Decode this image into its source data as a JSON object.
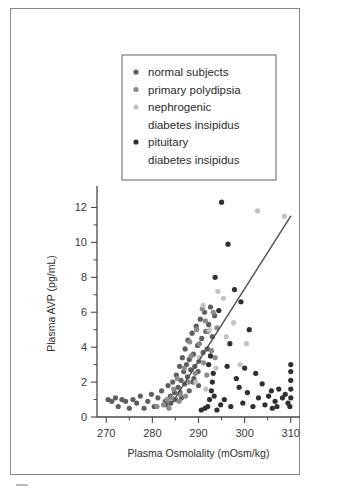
{
  "figure": {
    "frame_visible": true,
    "background": "#ffffff"
  },
  "chart_data": {
    "type": "scatter",
    "title": "",
    "xlabel": "Plasma Osmolality (mOsm/kg)",
    "ylabel": "Plasma AVP (pg/mL)",
    "xlim": [
      268,
      312
    ],
    "ylim": [
      0,
      13
    ],
    "xticks": [
      270,
      280,
      290,
      300,
      310
    ],
    "xtick_labels": [
      "270",
      "280",
      "290",
      "300",
      "310"
    ],
    "xticks_minor": [
      275,
      285,
      295,
      305
    ],
    "yticks": [
      0,
      2,
      4,
      6,
      8,
      10,
      12
    ],
    "ytick_labels": [
      "0",
      "2",
      "4",
      "6",
      "8",
      "10",
      "12"
    ],
    "yticks_minor": [
      1,
      3,
      5,
      7,
      9,
      11
    ],
    "grid": false,
    "legend_position": "upper-center",
    "marker_radius": 2.6,
    "series": [
      {
        "name": "normal subjects",
        "color": "#5f5f5f",
        "points": [
          [
            270.4,
            1.0
          ],
          [
            271.2,
            0.9
          ],
          [
            272.0,
            1.1
          ],
          [
            272.6,
            0.6
          ],
          [
            273.4,
            1.0
          ],
          [
            274.2,
            0.9
          ],
          [
            275.0,
            0.5
          ],
          [
            275.8,
            1.0
          ],
          [
            276.6,
            0.8
          ],
          [
            277.4,
            1.2
          ],
          [
            278.2,
            0.5
          ],
          [
            279.0,
            0.9
          ],
          [
            279.8,
            1.3
          ],
          [
            280.4,
            0.6
          ],
          [
            281.2,
            1.1
          ],
          [
            282.0,
            1.5
          ],
          [
            282.8,
            0.9
          ],
          [
            283.4,
            1.8
          ],
          [
            283.9,
            1.2
          ],
          [
            284.4,
            2.0
          ],
          [
            284.8,
            1.4
          ],
          [
            285.2,
            2.4
          ],
          [
            285.6,
            1.7
          ],
          [
            285.9,
            2.9
          ],
          [
            286.2,
            2.1
          ],
          [
            286.5,
            3.4
          ],
          [
            286.8,
            2.6
          ],
          [
            287.1,
            3.9
          ],
          [
            287.4,
            3.0
          ],
          [
            287.7,
            4.4
          ],
          [
            288.0,
            3.3
          ],
          [
            288.3,
            2.7
          ],
          [
            288.6,
            4.8
          ],
          [
            288.9,
            3.6
          ],
          [
            289.2,
            2.9
          ],
          [
            289.5,
            5.2
          ],
          [
            289.8,
            4.1
          ],
          [
            290.1,
            3.2
          ],
          [
            290.4,
            5.6
          ],
          [
            290.7,
            4.5
          ],
          [
            291.0,
            3.7
          ],
          [
            291.3,
            6.0
          ],
          [
            291.6,
            4.9
          ],
          [
            291.9,
            3.9
          ],
          [
            292.2,
            5.3
          ],
          [
            292.6,
            6.3
          ],
          [
            293.0,
            4.6
          ],
          [
            293.5,
            5.8
          ],
          [
            285.0,
            1.0
          ],
          [
            286.0,
            1.4
          ],
          [
            287.0,
            1.9
          ],
          [
            288.0,
            1.5
          ],
          [
            289.0,
            2.2
          ],
          [
            290.0,
            1.8
          ],
          [
            284.0,
            0.8
          ],
          [
            283.0,
            0.7
          ],
          [
            286.3,
            1.1
          ],
          [
            287.6,
            2.3
          ],
          [
            288.8,
            2.0
          ],
          [
            289.9,
            2.6
          ]
        ]
      },
      {
        "name": "primary polydipsia",
        "color": "#8c8c8c",
        "points": [
          [
            281.0,
            0.6
          ],
          [
            282.4,
            0.7
          ],
          [
            283.2,
            1.0
          ],
          [
            284.6,
            1.6
          ],
          [
            285.4,
            2.2
          ],
          [
            286.0,
            1.3
          ],
          [
            286.9,
            2.8
          ],
          [
            287.8,
            2.0
          ],
          [
            288.4,
            3.5
          ],
          [
            289.3,
            2.5
          ],
          [
            290.2,
            4.2
          ],
          [
            291.1,
            3.1
          ],
          [
            292.0,
            4.9
          ],
          [
            292.8,
            3.8
          ],
          [
            290.8,
            6.2
          ],
          [
            291.5,
            5.5
          ],
          [
            289.6,
            5.0
          ],
          [
            288.1,
            4.3
          ],
          [
            293.2,
            6.0
          ],
          [
            294.0,
            5.1
          ],
          [
            287.2,
            1.2
          ],
          [
            285.8,
            0.9
          ],
          [
            284.2,
            1.1
          ],
          [
            283.6,
            0.5
          ],
          [
            291.8,
            2.4
          ],
          [
            293.6,
            3.4
          ]
        ]
      },
      {
        "name": "nephrogenic diabetes insipidus",
        "color": "#c3c3c3",
        "points": [
          [
            291.0,
            6.4
          ],
          [
            292.4,
            5.0
          ],
          [
            294.2,
            7.2
          ],
          [
            296.0,
            4.6
          ],
          [
            297.6,
            5.4
          ],
          [
            299.0,
            3.0
          ],
          [
            302.8,
            11.8
          ],
          [
            308.6,
            11.5
          ],
          [
            290.2,
            3.4
          ],
          [
            293.8,
            2.8
          ],
          [
            295.4,
            6.8
          ],
          [
            300.4,
            4.2
          ],
          [
            289.4,
            2.0
          ],
          [
            291.6,
            1.6
          ]
        ]
      },
      {
        "name": "pituitary diabetes insipidus",
        "color": "#2f2f2f",
        "points": [
          [
            295.0,
            12.3
          ],
          [
            296.4,
            9.9
          ],
          [
            293.6,
            8.0
          ],
          [
            297.8,
            7.3
          ],
          [
            294.4,
            6.1
          ],
          [
            299.2,
            6.6
          ],
          [
            301.0,
            5.0
          ],
          [
            296.8,
            4.2
          ],
          [
            302.4,
            2.5
          ],
          [
            298.2,
            2.2
          ],
          [
            303.8,
            1.9
          ],
          [
            300.6,
            1.4
          ],
          [
            305.2,
            1.2
          ],
          [
            306.6,
            0.9
          ],
          [
            307.4,
            1.6
          ],
          [
            308.2,
            1.1
          ],
          [
            309.8,
            0.6
          ],
          [
            310.0,
            1.1
          ],
          [
            310.0,
            1.6
          ],
          [
            310.0,
            2.1
          ],
          [
            310.0,
            2.6
          ],
          [
            310.0,
            3.0
          ],
          [
            309.4,
            0.8
          ],
          [
            308.8,
            1.3
          ],
          [
            292.0,
            0.6
          ],
          [
            292.4,
            1.0
          ],
          [
            292.8,
            1.5
          ],
          [
            293.0,
            2.0
          ],
          [
            293.2,
            2.5
          ],
          [
            292.2,
            3.0
          ],
          [
            292.6,
            3.5
          ],
          [
            293.4,
            1.2
          ],
          [
            291.4,
            0.5
          ],
          [
            294.8,
            0.7
          ],
          [
            295.6,
            1.0
          ],
          [
            297.0,
            0.6
          ],
          [
            299.6,
            0.8
          ],
          [
            301.8,
            0.6
          ],
          [
            304.4,
            0.7
          ],
          [
            306.0,
            0.5
          ],
          [
            290.6,
            0.4
          ],
          [
            294.0,
            0.4
          ],
          [
            303.0,
            1.1
          ],
          [
            305.8,
            1.5
          ],
          [
            307.0,
            0.6
          ],
          [
            298.8,
            1.7
          ],
          [
            300.0,
            2.8
          ],
          [
            296.2,
            2.9
          ]
        ]
      }
    ],
    "fit_line": {
      "name": "regression-line",
      "color": "#4e4e4e",
      "x_start": 284.0,
      "y_start": 0.7,
      "x_end": 310.0,
      "y_end": 11.5
    }
  },
  "legend": {
    "entries": [
      {
        "label": "normal subjects",
        "color": "#5f5f5f"
      },
      {
        "label": "primary polydipsia",
        "color": "#8c8c8c"
      },
      {
        "label": "nephrogenic",
        "label2": "diabetes insipidus",
        "color": "#c3c3c3"
      },
      {
        "label": "pituitary",
        "label2": "diabetes insipidus",
        "color": "#2f2f2f"
      }
    ]
  }
}
